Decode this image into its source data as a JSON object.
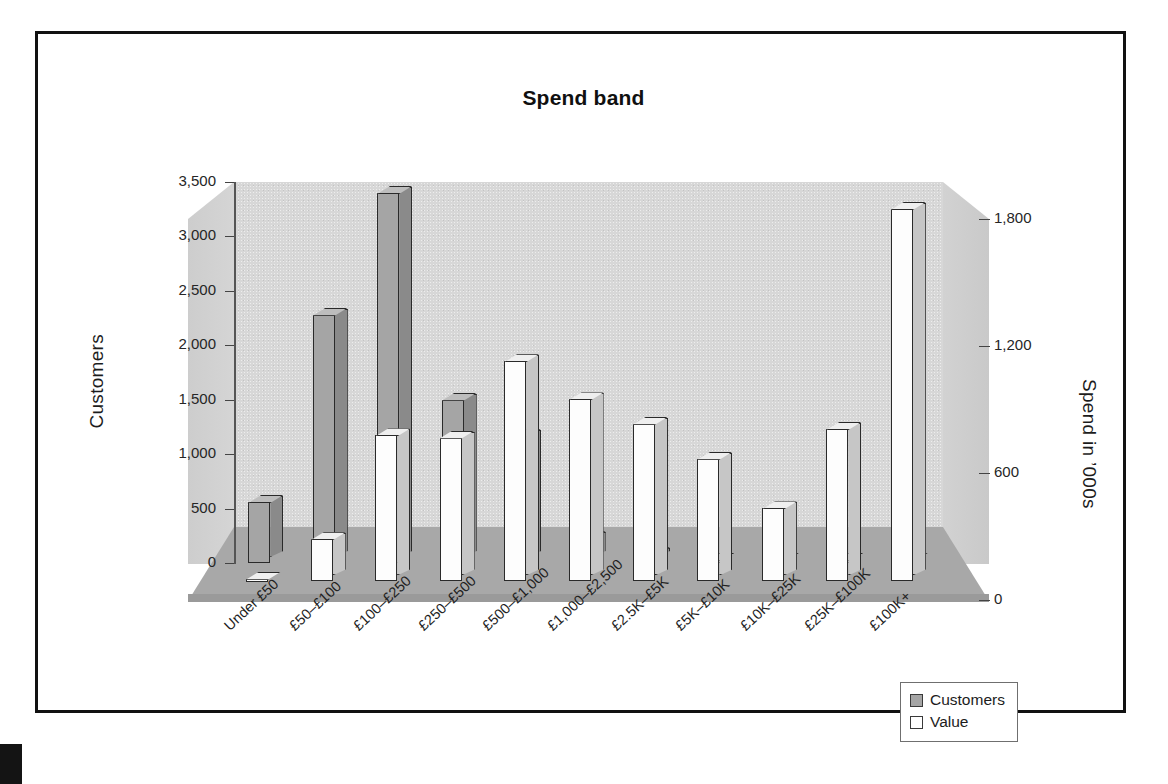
{
  "figure": {
    "title": "Spend band",
    "legend": {
      "position": "bottom-right",
      "items": [
        {
          "label": "Customers",
          "swatch": "#a5a5a5"
        },
        {
          "label": "Value",
          "swatch": "#ffffff"
        }
      ]
    }
  },
  "axes": {
    "left": {
      "title": "Customers",
      "ticks": [
        "0",
        "500",
        "1,000",
        "1,500",
        "2,000",
        "2,500",
        "3,000",
        "3,500"
      ]
    },
    "right": {
      "title": "Spend in ’000s",
      "ticks": [
        "0",
        "600",
        "1,200",
        "1,800"
      ]
    }
  },
  "chart_data": {
    "type": "bar",
    "title": "Spend band",
    "xlabel": "",
    "ylabel": "Customers",
    "y2label": "Spend in ’000s",
    "ylim": [
      0,
      3500
    ],
    "y2lim": [
      0,
      1800
    ],
    "yticks": [
      0,
      500,
      1000,
      1500,
      2000,
      2500,
      3000,
      3500
    ],
    "y2ticks": [
      0,
      600,
      1200,
      1800
    ],
    "grid": false,
    "legend_position": "bottom-right",
    "categories": [
      "Under £50",
      "£50–£100",
      "£100–£250",
      "£250–£500",
      "£500–£1,000",
      "£1,000–£2,500",
      "£2.5K–£5K",
      "£5K–£10K",
      "£10K–£25K",
      "£25K–£100K",
      "£100K+"
    ],
    "series": [
      {
        "name": "Customers",
        "axis": "left",
        "color": "#a5a5a5",
        "values": [
          560,
          2280,
          3400,
          1500,
          1170,
          230,
          80,
          20,
          10,
          8,
          5
        ]
      },
      {
        "name": "Value",
        "axis": "right",
        "color": "#ffffff",
        "values": [
          10,
          200,
          690,
          680,
          1040,
          860,
          745,
          580,
          345,
          720,
          1760
        ]
      }
    ]
  }
}
